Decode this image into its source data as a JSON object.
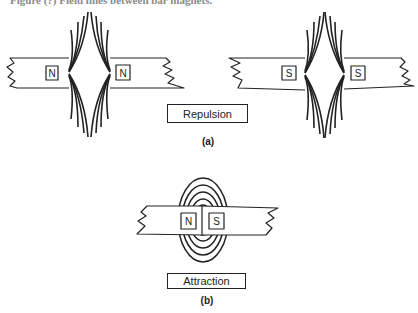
{
  "header": {
    "cut_off_text": "Figure (?) Field lines between bar magnets."
  },
  "figure_a": {
    "caption": "(a)",
    "label": "Repulsion",
    "pairs": [
      {
        "left_pole": "N",
        "right_pole": "N"
      },
      {
        "left_pole": "S",
        "right_pole": "S"
      }
    ]
  },
  "figure_b": {
    "caption": "(b)",
    "label": "Attraction",
    "left_pole": "N",
    "right_pole": "S"
  },
  "colors": {
    "ink": "#222222",
    "background": "#ffffff"
  }
}
